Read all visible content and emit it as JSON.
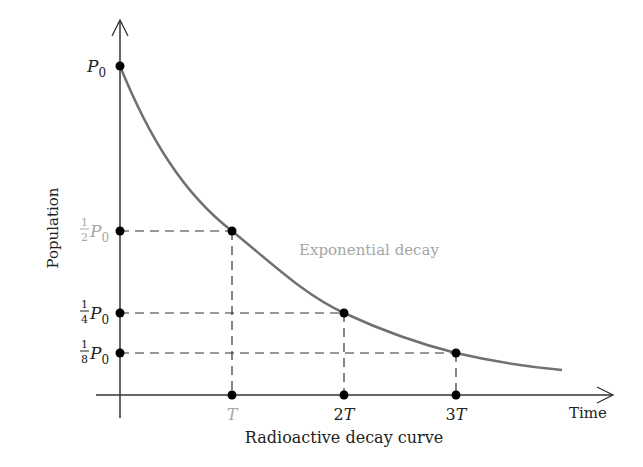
{
  "diagram": {
    "caption": "Radioactive decay curve",
    "x_axis_label": "Time",
    "y_axis_label": "Population",
    "curve_label": "Exponential decay",
    "y_ticks": [
      {
        "frac": "",
        "sym": "P",
        "sub": "0",
        "value": "P0"
      },
      {
        "frac_num": "1",
        "frac_den": "2",
        "sym": "P",
        "sub": "0",
        "value": "1/2 P0"
      },
      {
        "frac_num": "1",
        "frac_den": "4",
        "sym": "P",
        "sub": "0",
        "value": "1/4 P0"
      },
      {
        "frac_num": "1",
        "frac_den": "8",
        "sym": "P",
        "sub": "0",
        "value": "1/8 P0"
      }
    ],
    "x_ticks": [
      {
        "label": "T"
      },
      {
        "label_num": "2",
        "label_var": "T"
      },
      {
        "label_num": "3",
        "label_var": "T"
      }
    ],
    "colors": {
      "axis": "#333333",
      "curve": "#707070",
      "highlight_label": "#a6a6a6",
      "points": "#000000"
    }
  }
}
